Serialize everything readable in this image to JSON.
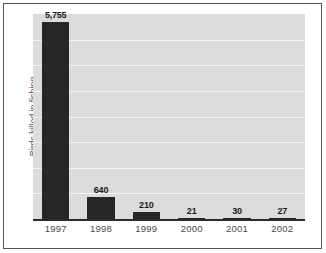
{
  "chart_data": {
    "type": "bar",
    "title": "",
    "subtitle": "",
    "xlabel": "",
    "ylabel": "Birds killed in fishing",
    "categories": [
      "1997",
      "1998",
      "1999",
      "2000",
      "2001",
      "2002"
    ],
    "values": [
      5755,
      640,
      210,
      21,
      30,
      27
    ],
    "data_labels": [
      "5,755",
      "640",
      "210",
      "21",
      "30",
      "27"
    ],
    "ylim": [
      0,
      6000
    ],
    "gridlines": true,
    "gridline_count": 7,
    "legend": null,
    "legend_position": "none",
    "annotations": [],
    "series": [
      {
        "name": "Birds killed in fishing",
        "values": [
          5755,
          640,
          210,
          21,
          30,
          27
        ]
      }
    ]
  },
  "style": {
    "bar_color": "#262626",
    "plot_background": "#dcdcdc",
    "gridline_color": "#f4f4f4",
    "axis_color": "#2b2b2b",
    "label_color": "#1a1a1a",
    "tick_color": "#4a4a4a",
    "axis_title_color": "#59595b",
    "page_background": "#ffffff",
    "frame_color": "#555555"
  }
}
